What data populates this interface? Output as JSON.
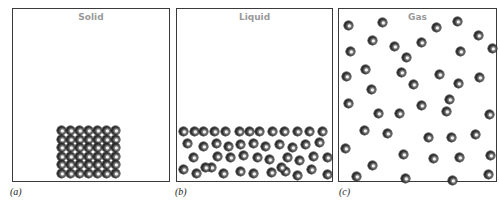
{
  "figure": {
    "panels": [
      {
        "id": "a",
        "title": "Solid",
        "caption": "(a)",
        "arrangement": "ordered lattice, 7 columns x 6 rows, packed at bottom",
        "molecule_count": 42
      },
      {
        "id": "b",
        "title": "Liquid",
        "caption": "(b)",
        "arrangement": "close but disordered, filling bottom of container",
        "molecule_count": 47
      },
      {
        "id": "c",
        "title": "Gas",
        "caption": "(c)",
        "arrangement": "widely spaced, randomly filling entire container",
        "molecule_count": 40
      }
    ],
    "colors": {
      "border": "#3a3a3a",
      "title": "#9a9a9a",
      "caption": "#222222",
      "molecule": "#2a2a2a"
    }
  }
}
